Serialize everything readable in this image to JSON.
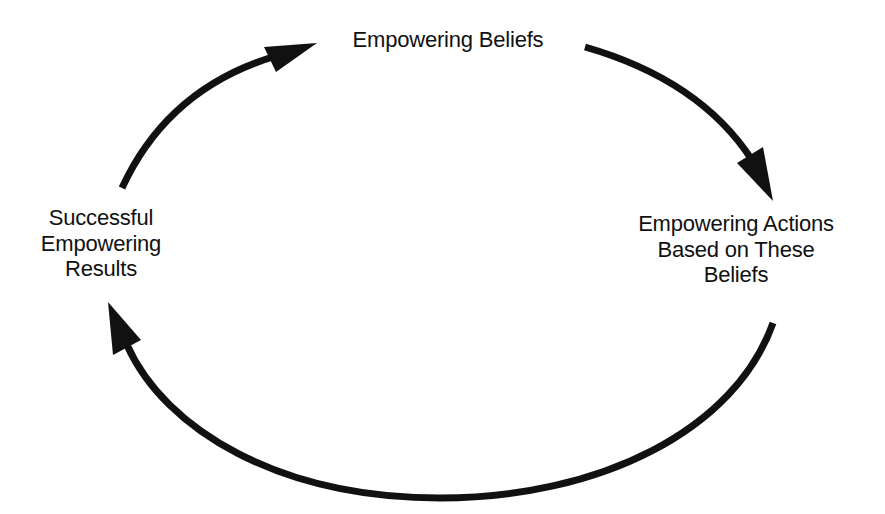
{
  "diagram": {
    "type": "cycle",
    "colors": {
      "background": "#ffffff",
      "ink": "#111111"
    },
    "nodes": [
      {
        "id": "top",
        "lines": [
          "Empowering Beliefs"
        ]
      },
      {
        "id": "right",
        "lines": [
          "Empowering Actions",
          "Based on These",
          "Beliefs"
        ]
      },
      {
        "id": "left",
        "lines": [
          "Successful",
          "Empowering",
          "Results"
        ]
      }
    ],
    "edges": [
      {
        "from": "Successful Empowering Results",
        "to": "Empowering Beliefs"
      },
      {
        "from": "Empowering Beliefs",
        "to": "Empowering Actions Based on These Beliefs"
      },
      {
        "from": "Empowering Actions Based on These Beliefs",
        "to": "Successful Empowering Results"
      }
    ]
  }
}
